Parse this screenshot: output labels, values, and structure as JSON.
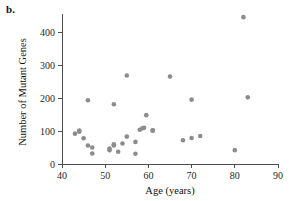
{
  "figure": {
    "panel_label": "b."
  },
  "chart_data": {
    "type": "scatter",
    "title": "",
    "xlabel": "Age (years)",
    "ylabel": "Number of Mutant Genes",
    "xlim": [
      40,
      90
    ],
    "ylim": [
      0,
      450
    ],
    "xticks": [
      40,
      50,
      60,
      70,
      80,
      90
    ],
    "xtick_labels": [
      "40",
      "50",
      "60",
      "70",
      "80",
      "90"
    ],
    "yticks": [
      0,
      100,
      200,
      300,
      400
    ],
    "ytick_labels": [
      "0",
      "100",
      "200",
      "300",
      "400"
    ],
    "grid": false,
    "legend": null,
    "marker": {
      "shape": "circle",
      "color": "#8c8c8c",
      "size": 4.6
    },
    "series": [
      {
        "name": "Samples",
        "x": [
          43,
          44,
          44,
          45,
          46,
          46,
          47,
          47,
          51,
          51,
          52,
          52,
          52,
          53,
          54,
          55,
          55,
          57,
          57,
          58,
          58.6,
          59,
          59.5,
          61,
          61,
          65,
          68,
          70,
          70,
          72,
          80,
          82,
          83
        ],
        "y": [
          92,
          101,
          98,
          78,
          193,
          56,
          32,
          50,
          47,
          42,
          181,
          60,
          56,
          37,
          62,
          268,
          83,
          67,
          31,
          104,
          108,
          110,
          148,
          102,
          101,
          265,
          72,
          195,
          79,
          85,
          42,
          445,
          202
        ]
      }
    ]
  },
  "axis_geometry": {
    "x_pixel_min": 62,
    "x_pixel_max": 278,
    "y_pixel_zero": 164,
    "y_pixel_per_unit": 0.33
  }
}
